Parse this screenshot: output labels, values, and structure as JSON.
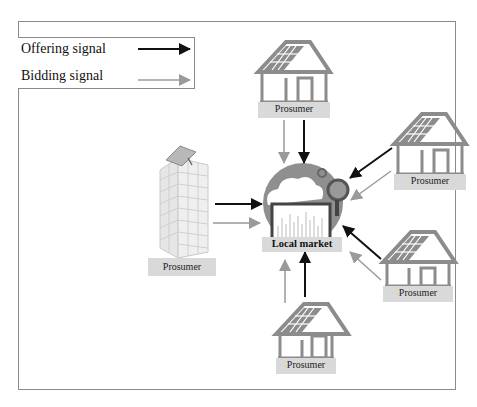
{
  "legend": {
    "items": [
      {
        "label": "Offering signal",
        "color": "#111111",
        "style": "solid-black-arrow"
      },
      {
        "label": "Bidding signal",
        "color": "#9a9a9a",
        "style": "gray-arrow"
      }
    ]
  },
  "nodes": {
    "market": {
      "label": "Local market",
      "icon": "cloud-globe-chart-magnifier-icon"
    },
    "building": {
      "label": "Prosumer",
      "icon": "solar-building-icon"
    },
    "house_top": {
      "label": "Prosumer",
      "icon": "solar-house-icon"
    },
    "house_upper_right": {
      "label": "Prosumer",
      "icon": "solar-house-icon"
    },
    "house_lower_right": {
      "label": "Prosumer",
      "icon": "solar-house-icon"
    },
    "house_bottom": {
      "label": "Prosumer",
      "icon": "solar-house-icon"
    }
  },
  "colors": {
    "offering": "#111111",
    "bidding": "#9a9a9a",
    "label_bg": "#d9d9d9",
    "icon_gray": "#8c8c8c",
    "frame": "#8a8a8a"
  }
}
